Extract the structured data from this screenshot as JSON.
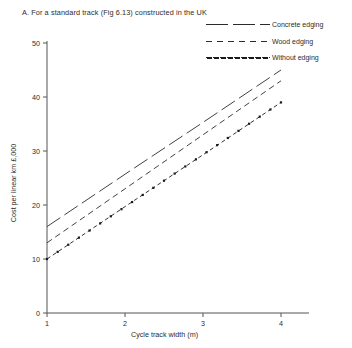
{
  "figure": {
    "caption": "A. For a standard track (Fig 6.13) constructed in the UK"
  },
  "chart_data": {
    "type": "line",
    "title": "A. For a standard track (Fig 6.13) constructed in the UK",
    "xlabel": "Cycle track width (m)",
    "ylabel": "Cost per linear km £,000",
    "x": [
      1,
      2,
      3,
      4
    ],
    "xlim": [
      1,
      4
    ],
    "ylim": [
      0,
      50
    ],
    "xticks": [
      "1",
      "2",
      "3",
      "4"
    ],
    "yticks": [
      "0",
      "10",
      "20",
      "30",
      "40",
      "50"
    ],
    "grid": false,
    "legend_position": "top-right",
    "series": [
      {
        "name": "Concrete edging",
        "values": [
          16,
          25.7,
          35.3,
          45
        ],
        "linestyle": "long-dash",
        "color": "#2b2b2b",
        "marker": "none"
      },
      {
        "name": "Wood  edging",
        "values": [
          13,
          23,
          33,
          43
        ],
        "linestyle": "dashed",
        "color": "#2b2b2b",
        "marker": "none"
      },
      {
        "name": "Without edging",
        "values": [
          10,
          19.7,
          29.3,
          39
        ],
        "linestyle": "dot-dash",
        "color": "#1a1a1a",
        "marker": "square"
      }
    ]
  },
  "axes": {
    "x_axis_label": "Cycle track width (m)",
    "y_axis_label": "Cost per linear km £,000"
  }
}
